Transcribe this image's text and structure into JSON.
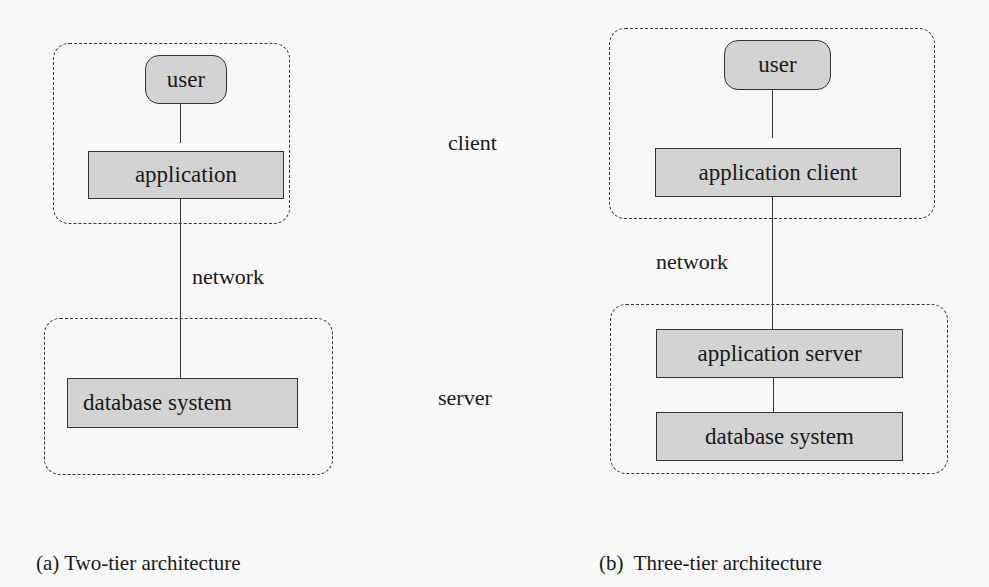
{
  "diagram": {
    "background": "#f8f8f8",
    "node_fill": "#d2d2d2",
    "stroke": "#333333",
    "middle_labels": {
      "client": "client",
      "server": "server"
    },
    "two_tier": {
      "caption": "(a) Two-tier architecture",
      "client_group": {
        "nodes": [
          {
            "id": "user",
            "label": "user",
            "shape": "rounded"
          },
          {
            "id": "application",
            "label": "application",
            "shape": "rect"
          }
        ]
      },
      "network_label": "network",
      "server_group": {
        "nodes": [
          {
            "id": "database-system",
            "label": "database system",
            "shape": "rect"
          }
        ]
      },
      "edges": [
        [
          "user",
          "application"
        ],
        [
          "application",
          "database-system"
        ]
      ]
    },
    "three_tier": {
      "caption": "(b)  Three-tier architecture",
      "client_group": {
        "nodes": [
          {
            "id": "user",
            "label": "user",
            "shape": "rounded"
          },
          {
            "id": "application-client",
            "label": "application client",
            "shape": "rect"
          }
        ]
      },
      "network_label": "network",
      "server_group": {
        "nodes": [
          {
            "id": "application-server",
            "label": "application server",
            "shape": "rect"
          },
          {
            "id": "database-system",
            "label": "database system",
            "shape": "rect"
          }
        ]
      },
      "edges": [
        [
          "user",
          "application-client"
        ],
        [
          "application-client",
          "application-server"
        ],
        [
          "application-server",
          "database-system"
        ]
      ]
    }
  }
}
